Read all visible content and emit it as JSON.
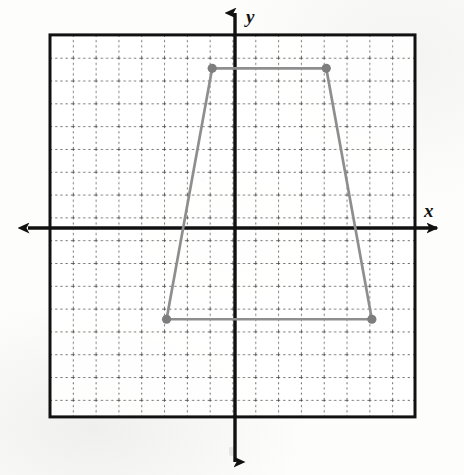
{
  "figure": {
    "kind": "coordinate-grid-plot",
    "axis_labels": {
      "x": "x",
      "y": "y"
    },
    "colors": {
      "border": "#111111",
      "axis": "#111111",
      "gridline": "#3a3a3a",
      "shape_stroke": "#8e8e8e",
      "shape_vertex": "#7d7d7d",
      "background": "#fdfdfc"
    }
  },
  "chart_data": {
    "type": "scatter",
    "title": "",
    "xlabel": "x",
    "ylabel": "y",
    "grid": true,
    "legend": "none",
    "xlim": [
      -8,
      8
    ],
    "ylim": [
      -8.3,
      8.3
    ],
    "x_major_step": 1,
    "y_major_step": 1,
    "x_tick_labels": [],
    "y_tick_labels": [],
    "annotations": [],
    "series": [
      {
        "name": "trapezoid",
        "type": "polygon",
        "closed": true,
        "marker": "filled-circle",
        "points": [
          {
            "label": "top-left",
            "x": -1,
            "y": 7
          },
          {
            "label": "top-right",
            "x": 4,
            "y": 7
          },
          {
            "label": "bottom-right",
            "x": 6,
            "y": -4
          },
          {
            "label": "bottom-left",
            "x": -3,
            "y": -4
          }
        ]
      }
    ]
  }
}
